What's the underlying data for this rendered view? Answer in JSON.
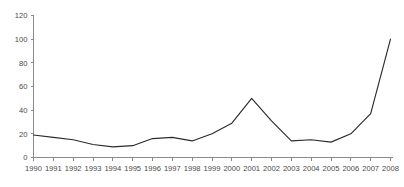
{
  "chart_data": {
    "type": "line",
    "title": "",
    "subtitle": "",
    "xlabel": "",
    "ylabel": "",
    "grid": false,
    "legend": false,
    "legend_position": "none",
    "line_color": "#2b2b2b",
    "axis_color": "#8a8a8a",
    "background_color": "#ffffff",
    "xlim": [
      1990,
      2008
    ],
    "ylim": [
      0,
      120
    ],
    "ytick_values": [
      0,
      20,
      40,
      60,
      80,
      100,
      120
    ],
    "ytick_labels": [
      "0",
      "20",
      "40",
      "60",
      "80",
      "100",
      "120"
    ],
    "categories": [
      "1990",
      "1991",
      "1992",
      "1993",
      "1994",
      "1995",
      "1996",
      "1997",
      "1998",
      "1999",
      "2000",
      "2001",
      "2002",
      "2003",
      "2004",
      "2005",
      "2006",
      "2007",
      "2008"
    ],
    "x": [
      1990,
      1991,
      1992,
      1993,
      1994,
      1995,
      1996,
      1997,
      1998,
      1999,
      2000,
      2001,
      2002,
      2003,
      2004,
      2005,
      2006,
      2007,
      2008
    ],
    "values": [
      19,
      17,
      15,
      11,
      9,
      10,
      16,
      17,
      14,
      20,
      29,
      50,
      31,
      14,
      15,
      13,
      20,
      37,
      100
    ],
    "series": [
      {
        "name": "series-1",
        "values": [
          19,
          17,
          15,
          11,
          9,
          10,
          16,
          17,
          14,
          20,
          29,
          50,
          31,
          14,
          15,
          13,
          20,
          37,
          100
        ]
      }
    ],
    "annotations": []
  }
}
